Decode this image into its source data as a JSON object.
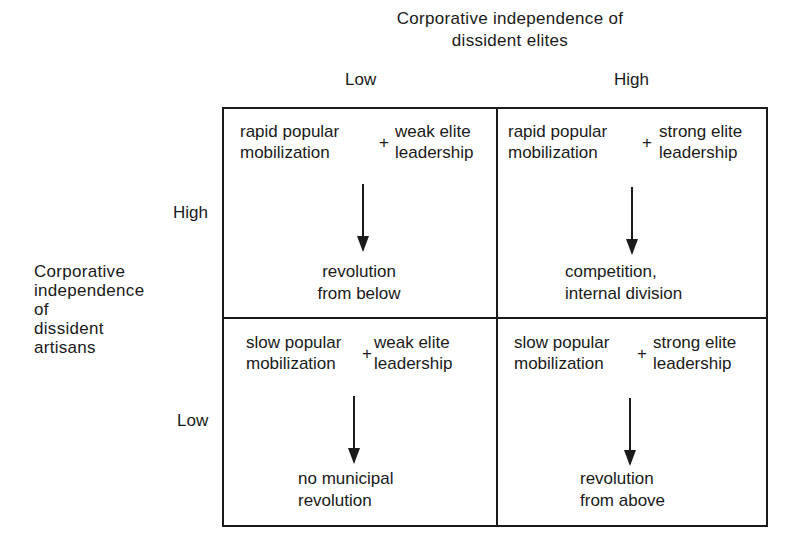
{
  "top_axis": {
    "title_line1": "Corporative independence of",
    "title_line2": "dissident elites",
    "low_label": "Low",
    "high_label": "High"
  },
  "left_axis": {
    "title_lines": [
      "Corporative",
      "independence",
      "of",
      "dissident",
      "artisans"
    ],
    "high_label": "High",
    "low_label": "Low"
  },
  "cells": [
    {
      "position": "top-left",
      "left_line1": "rapid popular",
      "left_line2": "mobilization",
      "plus": "+",
      "right_line1": "weak elite",
      "right_line2": "leadership",
      "outcome_line1": "revolution",
      "outcome_line2": "from below"
    },
    {
      "position": "top-right",
      "left_line1": "rapid popular",
      "left_line2": "mobilization",
      "plus": "+",
      "right_line1": "strong elite",
      "right_line2": "leadership",
      "outcome_line1": "competition,",
      "outcome_line2": "internal division"
    },
    {
      "position": "bottom-left",
      "left_line1": "slow popular",
      "left_line2": "mobilization",
      "plus": "+",
      "right_line1": "weak elite",
      "right_line2": "leadership",
      "outcome_line1": "no municipal",
      "outcome_line2": "revolution"
    },
    {
      "position": "bottom-right",
      "left_line1": "slow popular",
      "left_line2": "mobilization",
      "plus": "+",
      "right_line1": "strong elite",
      "right_line2": "leadership",
      "outcome_line1": "revolution",
      "outcome_line2": "from above"
    }
  ]
}
